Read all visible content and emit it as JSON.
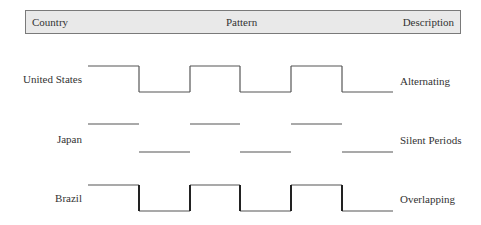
{
  "header": {
    "country_label": "Country",
    "pattern_label": "Pattern",
    "description_label": "Description"
  },
  "rows": [
    {
      "country": "United States",
      "description": "Alternating"
    },
    {
      "country": "Japan",
      "description": "Silent Periods"
    },
    {
      "country": "Brazil",
      "description": "Overlapping"
    }
  ],
  "chart_data": {
    "type": "waveform",
    "title": "",
    "columns": [
      "Country",
      "Pattern",
      "Description"
    ],
    "x_edges": [
      88,
      139,
      190,
      240,
      291,
      342,
      393
    ],
    "series": [
      {
        "name": "United States",
        "description": "Alternating",
        "levels": [
          1,
          0,
          1,
          0,
          1,
          0
        ],
        "y_high": 66,
        "y_low": 92,
        "show_transitions": true,
        "transition_width": 1.2,
        "line_color": "#555555",
        "transition_color": "#555555",
        "label_y": 79
      },
      {
        "name": "Japan",
        "description": "Silent Periods",
        "levels": [
          1,
          0,
          1,
          0,
          1,
          0
        ],
        "y_high": 124,
        "y_low": 152,
        "show_transitions": false,
        "transition_width": 0,
        "line_color": "#555555",
        "transition_color": "#555555",
        "label_y": 139
      },
      {
        "name": "Brazil",
        "description": "Overlapping",
        "levels": [
          1,
          0,
          1,
          0,
          1,
          0
        ],
        "y_high": 185,
        "y_low": 211,
        "show_transitions": true,
        "transition_width": 2,
        "line_color": "#555555",
        "transition_color": "#222222",
        "label_y": 198
      }
    ]
  }
}
